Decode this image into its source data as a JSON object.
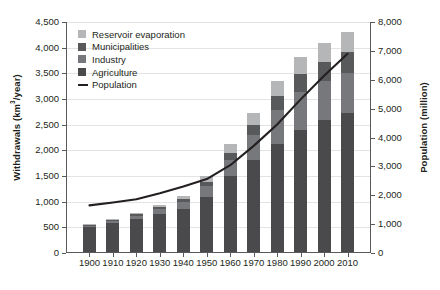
{
  "chart_data": {
    "type": "bar",
    "subtype": "stacked-bar-with-line",
    "title": "",
    "xlabel": "",
    "ylabel": "Withdrawals (km3/year)",
    "ylabel_right": "Population (million)",
    "ylim": [
      0,
      4500
    ],
    "ylim_right": [
      0,
      8000
    ],
    "yticks": [
      0,
      500,
      1000,
      1500,
      2000,
      2500,
      3000,
      3500,
      4000,
      4500
    ],
    "ytick_labels": [
      "0",
      "500",
      "1,000",
      "1,500",
      "2,000",
      "2,500",
      "3,000",
      "3,500",
      "4,000",
      "4,500"
    ],
    "yticks_right": [
      0,
      1000,
      2000,
      3000,
      4000,
      5000,
      6000,
      7000,
      8000
    ],
    "ytick_labels_right": [
      "0",
      "1,000",
      "2,000",
      "3,000",
      "4,000",
      "5,000",
      "6,000",
      "7,000",
      "8,000"
    ],
    "grid": true,
    "legend_position": "upper-left",
    "categories": [
      "1900",
      "1910",
      "1920",
      "1930",
      "1940",
      "1950",
      "1960",
      "1970",
      "1980",
      "1990",
      "2000",
      "2010"
    ],
    "series": [
      {
        "name": "Agriculture",
        "color": "#4a4a4c",
        "values": [
          490,
          560,
          650,
          740,
          840,
          1080,
          1480,
          1800,
          2110,
          2380,
          2570,
          2700
        ]
      },
      {
        "name": "Industry",
        "color": "#77787b",
        "values": [
          25,
          40,
          60,
          90,
          130,
          200,
          320,
          480,
          650,
          740,
          760,
          780
        ]
      },
      {
        "name": "Municipalities",
        "color": "#58595b",
        "values": [
          20,
          25,
          30,
          40,
          55,
          85,
          130,
          200,
          280,
          340,
          380,
          420
        ]
      },
      {
        "name": "Reservoir evaporation",
        "color": "#b5b6b8",
        "values": [
          10,
          15,
          25,
          40,
          60,
          110,
          170,
          230,
          290,
          330,
          360,
          380
        ]
      }
    ],
    "totals": [
      545,
      640,
      765,
      910,
      1085,
      1475,
      2100,
      2710,
      3330,
      3790,
      4070,
      4280
    ],
    "line_series": {
      "name": "Population",
      "color": "#231f20",
      "axis": "right",
      "values": [
        1650,
        1750,
        1860,
        2070,
        2300,
        2560,
        3040,
        3710,
        4450,
        5320,
        6140,
        6900
      ]
    }
  },
  "legend": {
    "items": [
      {
        "label": "Reservoir evaporation",
        "marker": "square",
        "color": "#b5b6b8"
      },
      {
        "label": "Municipalities",
        "marker": "square",
        "color": "#58595b"
      },
      {
        "label": "Industry",
        "marker": "square",
        "color": "#77787b"
      },
      {
        "label": "Agriculture",
        "marker": "square",
        "color": "#4a4a4c"
      },
      {
        "label": "Population",
        "marker": "line",
        "color": "#231f20"
      }
    ]
  },
  "axes": {
    "left_title_main": "Withdrawals (km",
    "left_title_sup": "3",
    "left_title_tail": "/year)",
    "right_title": "Population (million)"
  }
}
